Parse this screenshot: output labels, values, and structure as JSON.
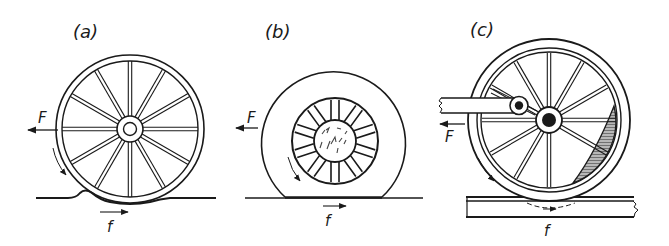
{
  "figure": {
    "panels": [
      {
        "id": "a",
        "label": "(a)",
        "description": "Spoked wheel rolling on soft ground, deforming surface ahead",
        "force_label": "F",
        "friction_label": "f"
      },
      {
        "id": "b",
        "label": "(b)",
        "description": "Pneumatic tyre flattened at contact patch on hard ground",
        "force_label": "F",
        "friction_label": "f"
      },
      {
        "id": "c",
        "label": "(c)",
        "description": "Locomotive driving wheel with connecting rod, crank pin and counterweight on rail",
        "force_label": "F",
        "friction_label": "f"
      }
    ],
    "colors": {
      "ink": "#1a1a1a",
      "background": "#ffffff",
      "hatch": "#8a8a8a"
    }
  }
}
